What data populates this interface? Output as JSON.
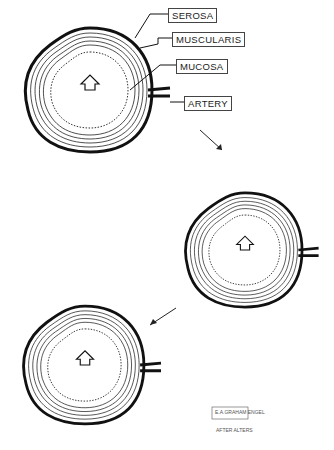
{
  "labels": {
    "serosa": "SEROSA",
    "muscularis": "MUSCULARIS",
    "mucosa": "MUCOSA",
    "artery": "ARTERY"
  },
  "signature": {
    "box_text": "E.A.GRAHAM ENGEL",
    "credit": "AFTER ALTERS"
  },
  "stages": [
    {
      "name": "stage-1",
      "arrow": "up-arrow-icon"
    },
    {
      "name": "stage-2",
      "arrow": "up-arrow-icon"
    },
    {
      "name": "stage-3",
      "arrow": "up-arrow-icon"
    }
  ]
}
